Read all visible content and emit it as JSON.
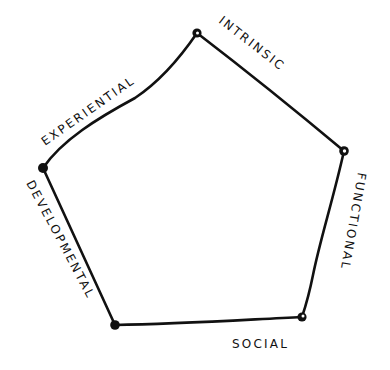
{
  "diagram": {
    "type": "pentagon",
    "style": "hand-drawn",
    "stroke_color": "#111111",
    "background": "#ffffff",
    "vertices": [
      {
        "name": "top",
        "x": 197,
        "y": 33
      },
      {
        "name": "right",
        "x": 344,
        "y": 151
      },
      {
        "name": "bottom-right",
        "x": 302,
        "y": 317
      },
      {
        "name": "bottom-left",
        "x": 115,
        "y": 325
      },
      {
        "name": "left",
        "x": 43,
        "y": 168
      }
    ],
    "sides": [
      {
        "id": "intrinsic",
        "label": "INTRINSIC",
        "between": [
          "top",
          "right"
        ]
      },
      {
        "id": "functional",
        "label": "FUNCTIONAL",
        "between": [
          "right",
          "bottom-right"
        ]
      },
      {
        "id": "social",
        "label": "SOCIAL",
        "between": [
          "bottom-right",
          "bottom-left"
        ]
      },
      {
        "id": "developmental",
        "label": "DEVELOPMENTAL",
        "between": [
          "bottom-left",
          "left"
        ]
      },
      {
        "id": "experiential",
        "label": "EXPERIENTIAL",
        "between": [
          "left",
          "top"
        ]
      }
    ]
  }
}
